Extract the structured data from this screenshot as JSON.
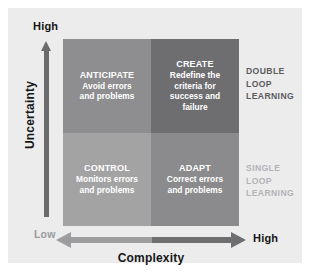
{
  "diagram": {
    "type": "2x2-matrix",
    "axes": {
      "y": {
        "label": "Uncertainty",
        "high_label": "High",
        "low_label": "Low",
        "direction": "upward"
      },
      "x": {
        "label": "Complexity",
        "low_label": "Low",
        "high_label": "High",
        "direction": "bidirectional"
      }
    },
    "quadrants": [
      {
        "id": "anticipate",
        "position": "top-left",
        "title": "ANTICIPATE",
        "body_lines": [
          "Avoid errors",
          "and problems"
        ],
        "color": "#8e8e90"
      },
      {
        "id": "create",
        "position": "top-right",
        "title": "CREATE",
        "body_lines": [
          "Redefine the",
          "criteria for",
          "success and",
          "failure"
        ],
        "color": "#6e6e71"
      },
      {
        "id": "control",
        "position": "bottom-left",
        "title": "CONTROL",
        "body_lines": [
          "Monitors errors",
          "and problems"
        ],
        "color": "#a3a3a4"
      },
      {
        "id": "adapt",
        "position": "bottom-right",
        "title": "ADAPT",
        "body_lines": [
          "Correct errors",
          "and problems"
        ],
        "color": "#8b8b8d"
      }
    ],
    "legends": [
      {
        "id": "double-loop",
        "lines": [
          "DOUBLE",
          "LOOP",
          "LEARNING"
        ],
        "color": "#5b5b5d"
      },
      {
        "id": "single-loop",
        "lines": [
          "SINGLE",
          "LOOP",
          "LEARNING"
        ],
        "color": "#b3b3b5"
      }
    ],
    "background_color": "#ececed"
  }
}
